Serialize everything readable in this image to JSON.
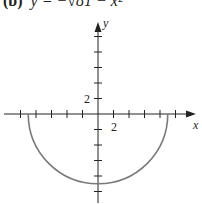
{
  "chart_data": {
    "type": "line",
    "title_label": "(b)",
    "title_formula": "y = −√81 − x²",
    "xlabel": "x",
    "ylabel": "y",
    "x_tick_label": "2",
    "y_tick_label": "2",
    "tick_step": 2,
    "xlim": [
      -10,
      12
    ],
    "ylim": [
      -11,
      11
    ],
    "grid": false,
    "series": [
      {
        "name": "y = -sqrt(81 - x^2)",
        "description": "lower semicircle of radius 9 centered at origin",
        "x": [
          -9,
          -8,
          -6,
          -4,
          -2,
          0,
          2,
          4,
          6,
          8,
          9
        ],
        "y": [
          0,
          -4.12,
          -6.71,
          -8.06,
          -8.78,
          -9,
          -8.78,
          -8.06,
          -6.71,
          -4.12,
          0
        ],
        "color": "#7a7a7a"
      }
    ]
  },
  "colors": {
    "axis": "#222222",
    "curve": "#7a7a7a"
  }
}
